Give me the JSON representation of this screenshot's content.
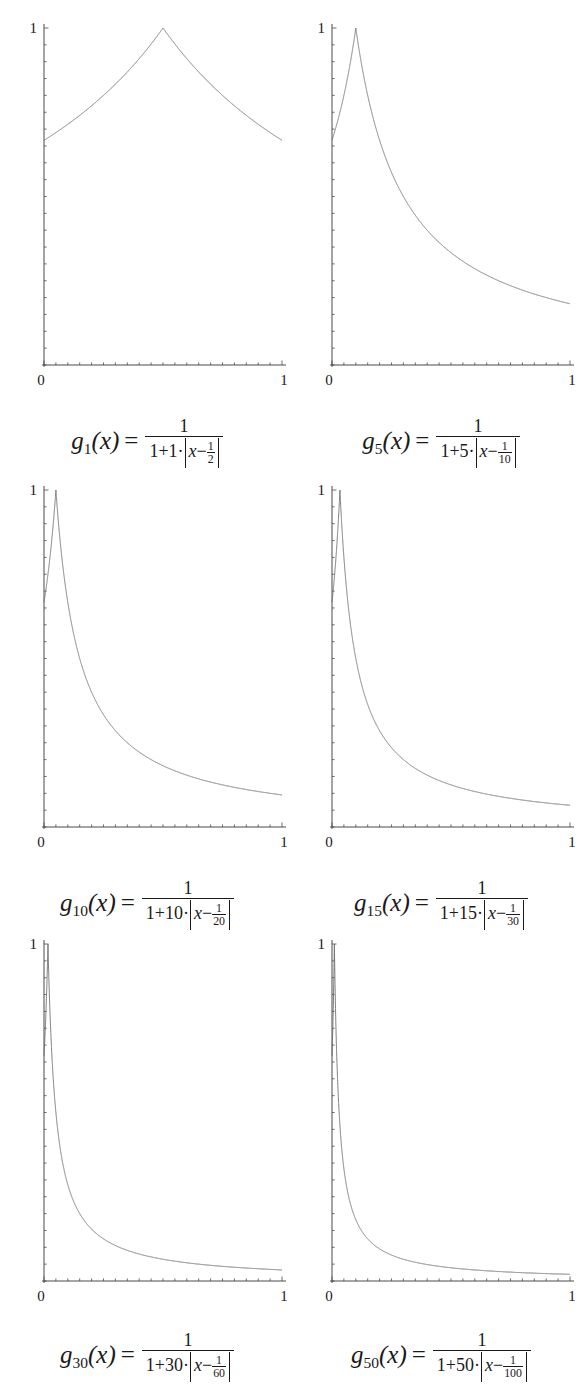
{
  "figure": {
    "background": "#ffffff",
    "curve_color": "#6e6e6e",
    "axis_color": "#4a4a4a",
    "text_color": "#1a1a1a",
    "rows": 3,
    "cols": 2
  },
  "axis": {
    "x_tick_min": "0",
    "x_tick_max": "1",
    "y_tick_max": "1",
    "x_range": [
      0,
      1
    ],
    "y_range": [
      0,
      1
    ],
    "minor_ticks_x": 20,
    "minor_ticks_y": 20
  },
  "panels": [
    {
      "id": "g1",
      "n": 1,
      "shift_den": 2,
      "caption_name": "g",
      "caption_sub": "1",
      "caption_arg": "(x)",
      "caption_eq": "=",
      "caption_num": "1",
      "caption_den_lead": "1+1·",
      "caption_den_var": "x",
      "caption_den_minus": "−",
      "caption_den_frac_num": "1",
      "caption_den_frac_den": "2",
      "caption_text": "g_1(x) = 1 / (1 + 1·|x − 1/2|)",
      "axis_x0": "0",
      "axis_x1": "1",
      "axis_y1": "1"
    },
    {
      "id": "g5",
      "n": 5,
      "shift_den": 10,
      "caption_name": "g",
      "caption_sub": "5",
      "caption_arg": "(x)",
      "caption_eq": "=",
      "caption_num": "1",
      "caption_den_lead": "1+5·",
      "caption_den_var": "x",
      "caption_den_minus": "−",
      "caption_den_frac_num": "1",
      "caption_den_frac_den": "10",
      "caption_text": "g_5(x) = 1 / (1 + 5·|x − 1/10|)",
      "axis_x0": "0",
      "axis_x1": "1",
      "axis_y1": "1"
    },
    {
      "id": "g10",
      "n": 10,
      "shift_den": 20,
      "caption_name": "g",
      "caption_sub": "10",
      "caption_arg": "(x)",
      "caption_eq": "=",
      "caption_num": "1",
      "caption_den_lead": "1+10·",
      "caption_den_var": "x",
      "caption_den_minus": "−",
      "caption_den_frac_num": "1",
      "caption_den_frac_den": "20",
      "caption_text": "g_10(x) = 1 / (1 + 10·|x − 1/20|)",
      "axis_x0": "0",
      "axis_x1": "1",
      "axis_y1": "1"
    },
    {
      "id": "g15",
      "n": 15,
      "shift_den": 30,
      "caption_name": "g",
      "caption_sub": "15",
      "caption_arg": "(x)",
      "caption_eq": "=",
      "caption_num": "1",
      "caption_den_lead": "1+15·",
      "caption_den_var": "x",
      "caption_den_minus": "−",
      "caption_den_frac_num": "1",
      "caption_den_frac_den": "30",
      "caption_text": "g_15(x) = 1 / (1 + 15·|x − 1/30|)",
      "axis_x0": "0",
      "axis_x1": "1",
      "axis_y1": "1"
    },
    {
      "id": "g30",
      "n": 30,
      "shift_den": 60,
      "caption_name": "g",
      "caption_sub": "30",
      "caption_arg": "(x)",
      "caption_eq": "=",
      "caption_num": "1",
      "caption_den_lead": "1+30·",
      "caption_den_var": "x",
      "caption_den_minus": "−",
      "caption_den_frac_num": "1",
      "caption_den_frac_den": "60",
      "caption_text": "g_30(x) = 1 / (1 + 30·|x − 1/60|)",
      "axis_x0": "0",
      "axis_x1": "1",
      "axis_y1": "1"
    },
    {
      "id": "g50",
      "n": 50,
      "shift_den": 100,
      "caption_name": "g",
      "caption_sub": "50",
      "caption_arg": "(x)",
      "caption_eq": "=",
      "caption_num": "1",
      "caption_den_lead": "1+50·",
      "caption_den_var": "x",
      "caption_den_minus": "−",
      "caption_den_frac_num": "1",
      "caption_den_frac_den": "100",
      "caption_text": "g_50(x) = 1 / (1 + 50·|x − 1/100|)",
      "axis_x0": "0",
      "axis_x1": "1",
      "axis_y1": "1"
    }
  ],
  "chart_data": {
    "type": "line",
    "title": "",
    "xlabel": "",
    "ylabel": "",
    "xlim": [
      0,
      1
    ],
    "ylim": [
      0,
      1
    ],
    "grid": false,
    "legend": "none",
    "x_ticks": [
      0,
      1
    ],
    "y_ticks": [
      1
    ],
    "x_tick_labels": [
      "0",
      "1"
    ],
    "y_tick_labels": [
      "1"
    ],
    "formula": "g_n(x) = 1 / (1 + n*abs(x - 1/(2n)))",
    "series": [
      {
        "name": "g_1",
        "n": 1,
        "peak_x": 0.5,
        "peak_y": 1.0,
        "y_at_0": 0.6667,
        "y_at_1": 0.6667,
        "samples_x": [
          0,
          0.1,
          0.2,
          0.3,
          0.4,
          0.5,
          0.6,
          0.7,
          0.8,
          0.9,
          1.0
        ],
        "samples_y": [
          0.667,
          0.714,
          0.769,
          0.833,
          0.909,
          1.0,
          0.909,
          0.833,
          0.769,
          0.714,
          0.667
        ]
      },
      {
        "name": "g_5",
        "n": 5,
        "peak_x": 0.1,
        "peak_y": 1.0,
        "y_at_0": 0.6667,
        "y_at_1": 0.1818,
        "samples_x": [
          0,
          0.05,
          0.1,
          0.2,
          0.3,
          0.4,
          0.5,
          0.6,
          0.7,
          0.8,
          0.9,
          1.0
        ],
        "samples_y": [
          0.667,
          0.8,
          1.0,
          0.667,
          0.5,
          0.4,
          0.333,
          0.286,
          0.25,
          0.222,
          0.2,
          0.182
        ]
      },
      {
        "name": "g_10",
        "n": 10,
        "peak_x": 0.05,
        "peak_y": 1.0,
        "y_at_0": 0.6667,
        "y_at_1": 0.0952,
        "samples_x": [
          0,
          0.025,
          0.05,
          0.1,
          0.2,
          0.3,
          0.4,
          0.5,
          0.6,
          0.8,
          1.0
        ],
        "samples_y": [
          0.667,
          0.8,
          1.0,
          0.667,
          0.4,
          0.286,
          0.222,
          0.182,
          0.154,
          0.118,
          0.095
        ]
      },
      {
        "name": "g_15",
        "n": 15,
        "peak_x": 0.0333,
        "peak_y": 1.0,
        "y_at_0": 0.6667,
        "y_at_1": 0.0645,
        "samples_x": [
          0,
          0.0167,
          0.0333,
          0.0667,
          0.133,
          0.2,
          0.3,
          0.4,
          0.6,
          0.8,
          1.0
        ],
        "samples_y": [
          0.667,
          0.8,
          1.0,
          0.667,
          0.4,
          0.286,
          0.196,
          0.149,
          0.101,
          0.076,
          0.065
        ]
      },
      {
        "name": "g_30",
        "n": 30,
        "peak_x": 0.0167,
        "peak_y": 1.0,
        "y_at_0": 0.6667,
        "y_at_1": 0.0328,
        "samples_x": [
          0,
          0.0083,
          0.0167,
          0.0333,
          0.0667,
          0.1,
          0.2,
          0.4,
          0.6,
          0.8,
          1.0
        ],
        "samples_y": [
          0.667,
          0.8,
          1.0,
          0.667,
          0.4,
          0.286,
          0.154,
          0.08,
          0.054,
          0.041,
          0.033
        ]
      },
      {
        "name": "g_50",
        "n": 50,
        "peak_x": 0.01,
        "peak_y": 1.0,
        "y_at_0": 0.6667,
        "y_at_1": 0.0198,
        "samples_x": [
          0,
          0.005,
          0.01,
          0.02,
          0.04,
          0.06,
          0.1,
          0.2,
          0.4,
          0.7,
          1.0
        ],
        "samples_y": [
          0.667,
          0.8,
          1.0,
          0.667,
          0.4,
          0.286,
          0.182,
          0.095,
          0.049,
          0.028,
          0.02
        ]
      }
    ]
  }
}
